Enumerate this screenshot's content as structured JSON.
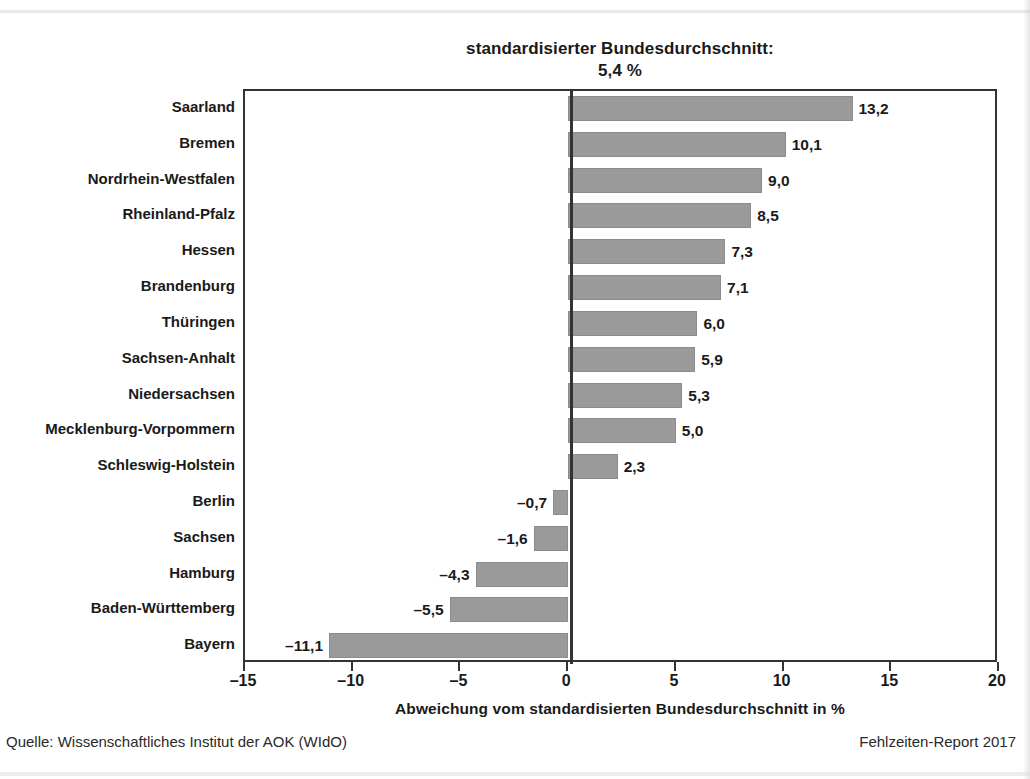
{
  "title": {
    "line1": "standardisierter Bundesdurchschnitt:",
    "line2": "5,4 %"
  },
  "footer": {
    "source": "Quelle: Wissenschaftliches Institut der AOK (WIdO)",
    "report": "Fehlzeiten-Report 2017"
  },
  "chart_data": {
    "type": "bar",
    "orientation": "horizontal",
    "title": "standardisierter Bundesdurchschnitt: 5,4 %",
    "xlabel": "Abweichung vom standardisierten Bundesdurchschnitt in %",
    "ylabel": "",
    "xlim": [
      -15,
      20
    ],
    "xticks": [
      -15,
      -10,
      -5,
      0,
      5,
      10,
      15,
      20
    ],
    "xtick_labels": [
      "–15",
      "–10",
      "–5",
      "0",
      "5",
      "10",
      "15",
      "20"
    ],
    "grid": false,
    "legend": null,
    "reference_line": 0,
    "bar_color": "#9a9a9a",
    "categories": [
      "Saarland",
      "Bremen",
      "Nordrhein-Westfalen",
      "Rheinland-Pfalz",
      "Hessen",
      "Brandenburg",
      "Thüringen",
      "Sachsen-Anhalt",
      "Niedersachsen",
      "Mecklenburg-Vorpommern",
      "Schleswig-Holstein",
      "Berlin",
      "Sachsen",
      "Hamburg",
      "Baden-Württemberg",
      "Bayern"
    ],
    "values": [
      13.2,
      10.1,
      9.0,
      8.5,
      7.3,
      7.1,
      6.0,
      5.9,
      5.3,
      5.0,
      2.3,
      -0.7,
      -1.6,
      -4.3,
      -5.5,
      -11.1
    ],
    "value_labels": [
      "13,2",
      "10,1",
      "9,0",
      "8,5",
      "7,3",
      "7,1",
      "6,0",
      "5,9",
      "5,3",
      "5,0",
      "2,3",
      "–0,7",
      "–1,6",
      "–4,3",
      "–5,5",
      "–11,1"
    ]
  }
}
